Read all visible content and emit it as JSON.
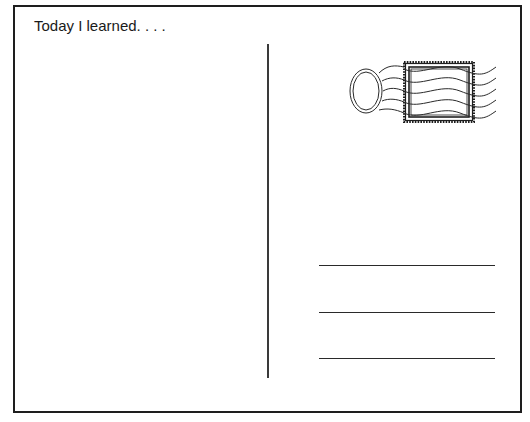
{
  "postcard": {
    "message_heading": "Today I learned. . . .",
    "stamp_icon": "postage-stamp-icon",
    "postmark_icon": "postmark-icon",
    "address_lines": [
      {
        "label": "address-line-1"
      },
      {
        "label": "address-line-2"
      },
      {
        "label": "address-line-3"
      }
    ],
    "colors": {
      "border": "#1e1e1e",
      "ink": "#1a1a1a",
      "background": "#ffffff"
    }
  }
}
